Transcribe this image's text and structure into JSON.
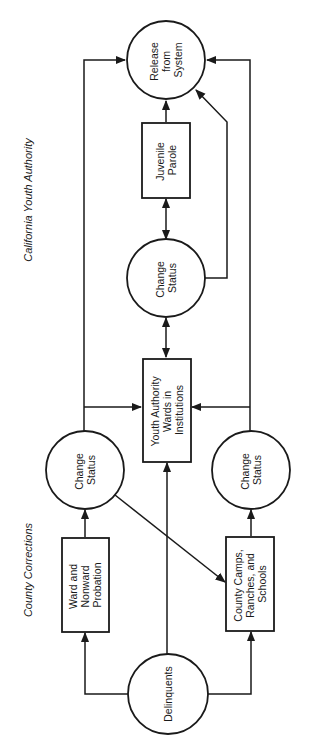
{
  "diagram": {
    "type": "flowchart",
    "orientation": "rotated-90-ccw",
    "sections": [
      {
        "id": "cya",
        "label": "California Youth Authority"
      },
      {
        "id": "county",
        "label": "County Corrections"
      }
    ],
    "nodes": [
      {
        "id": "release",
        "shape": "circle",
        "lines": [
          "Release",
          "from",
          "System"
        ]
      },
      {
        "id": "parole",
        "shape": "rect",
        "lines": [
          "Juvenile",
          "Parole"
        ]
      },
      {
        "id": "change_top",
        "shape": "circle",
        "lines": [
          "Change",
          "Status"
        ]
      },
      {
        "id": "institutions",
        "shape": "rect",
        "lines": [
          "Youth Authority",
          "Wards in",
          "Institutions"
        ]
      },
      {
        "id": "change_left",
        "shape": "circle",
        "lines": [
          "Change",
          "Status"
        ]
      },
      {
        "id": "change_right",
        "shape": "circle",
        "lines": [
          "Change",
          "Status"
        ]
      },
      {
        "id": "probation",
        "shape": "rect",
        "lines": [
          "Ward and",
          "Nonward",
          "Probation"
        ]
      },
      {
        "id": "camps",
        "shape": "rect",
        "lines": [
          "County Camps,",
          "Ranches, and",
          "Schools"
        ]
      },
      {
        "id": "delinquents",
        "shape": "circle",
        "lines": [
          "Delinquents"
        ]
      }
    ],
    "edges": [
      {
        "from": "delinquents",
        "to": "probation",
        "direction": "one-way"
      },
      {
        "from": "delinquents",
        "to": "camps",
        "direction": "one-way"
      },
      {
        "from": "delinquents",
        "to": "institutions",
        "direction": "one-way"
      },
      {
        "from": "probation",
        "to": "change_left",
        "direction": "one-way"
      },
      {
        "from": "camps",
        "to": "change_right",
        "direction": "one-way"
      },
      {
        "from": "change_left",
        "to": "camps",
        "direction": "one-way"
      },
      {
        "from": "change_left",
        "to": "institutions",
        "direction": "one-way"
      },
      {
        "from": "change_left",
        "to": "release",
        "direction": "one-way"
      },
      {
        "from": "change_right",
        "to": "institutions",
        "direction": "one-way"
      },
      {
        "from": "change_right",
        "to": "release",
        "direction": "one-way"
      },
      {
        "from": "institutions",
        "to": "change_top",
        "direction": "two-way"
      },
      {
        "from": "change_top",
        "to": "parole",
        "direction": "two-way"
      },
      {
        "from": "change_top",
        "to": "release",
        "direction": "one-way"
      },
      {
        "from": "parole",
        "to": "release",
        "direction": "one-way"
      }
    ]
  }
}
